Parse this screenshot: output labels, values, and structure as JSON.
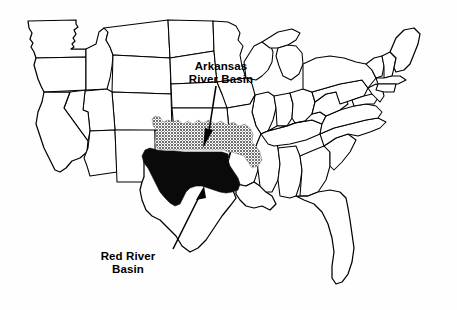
{
  "figure": {
    "kind": "thematic-map",
    "region": "Contiguous United States",
    "background_color": "#fefefe",
    "outline_color": "#000000",
    "width": 457,
    "height": 310
  },
  "labels": {
    "arkansas": {
      "text": "Arkansas\nRiver Basin",
      "line1": "Arkansas",
      "line2": "River Basin"
    },
    "red_river": {
      "text": "Red River\nBasin",
      "line1": "Red River",
      "line2": "Basin"
    }
  },
  "basins": [
    {
      "name": "Arkansas River Basin",
      "shading": "stippled gray",
      "color": "#8c8c8c",
      "states_covered": "Colorado, Kansas, Oklahoma, Arkansas"
    },
    {
      "name": "Red River Basin",
      "shading": "solid black",
      "color": "#0a0a0a",
      "states_covered": "Texas Panhandle, Oklahoma, Arkansas, Louisiana"
    }
  ],
  "annotations": [
    {
      "name": "arkansas-leader",
      "style": "straight arrow with filled head",
      "points_to": "Arkansas River Basin"
    },
    {
      "name": "red-river-leader",
      "style": "straight diagonal line",
      "points_to": "Red River Basin"
    }
  ]
}
